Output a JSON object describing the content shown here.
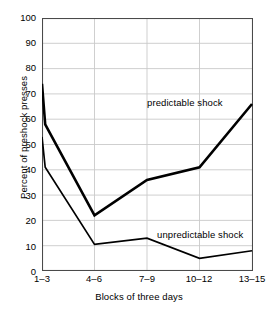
{
  "chart_data": {
    "type": "line",
    "title": "",
    "xlabel": "Blocks of three days",
    "ylabel": "Percent of preshock presses",
    "categories": [
      "1–3",
      "4–6",
      "7–9",
      "10–12",
      "13–15"
    ],
    "ylim": [
      0,
      100
    ],
    "yticks": [
      0,
      10,
      20,
      30,
      40,
      50,
      60,
      70,
      80,
      90,
      100
    ],
    "grid": true,
    "legend_position": "inline-annotations",
    "series": [
      {
        "name": "predictable shock",
        "values": [
          74,
          22,
          36,
          41,
          66
        ],
        "start_spike": 58,
        "color": "#000000",
        "width": 2.6
      },
      {
        "name": "unpredictable shock",
        "values": [
          53,
          10.5,
          13,
          5,
          8
        ],
        "start_spike": 41,
        "color": "#000000",
        "width": 1.7
      }
    ],
    "annotations": [
      {
        "text": "predictable shock",
        "series": "predictable shock"
      },
      {
        "text": "unpredictable shock",
        "series": "unpredictable shock"
      }
    ]
  },
  "axis": {
    "y_tick_labels": [
      "100",
      "90",
      "80",
      "70",
      "60",
      "50",
      "40",
      "30",
      "20",
      "10",
      "0"
    ],
    "x_tick_labels": [
      "1–3",
      "4–6",
      "7–9",
      "10–12",
      "13–15"
    ],
    "y_title": "Percent of preshock presses",
    "x_title": "Blocks of three days"
  },
  "labels": {
    "predictable": "predictable shock",
    "unpredictable": "unpredictable shock"
  },
  "colors": {
    "line": "#000000",
    "grid": "#c9c9c9",
    "frame": "#4a4a4a",
    "background": "#ffffff"
  }
}
